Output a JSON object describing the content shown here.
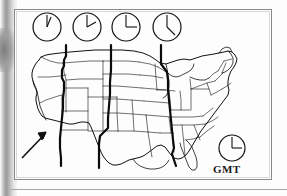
{
  "figure": {
    "kind": "us-time-zone-map",
    "title_text": "",
    "background_color": "#fdfdfd",
    "frame_color": "#8a8a8a",
    "ink_color": "#111111"
  },
  "clocks": {
    "timezone_row": [
      {
        "name": "pacific-clock",
        "cx": 47,
        "cy": 27,
        "r": 14,
        "hour_angle": 12,
        "minute_angle": 25,
        "label": ""
      },
      {
        "name": "mountain-clock",
        "cx": 87,
        "cy": 27,
        "r": 14,
        "hour_angle": 12,
        "minute_angle": 75,
        "label": ""
      },
      {
        "name": "central-clock",
        "cx": 126,
        "cy": 27,
        "r": 14,
        "hour_angle": 12,
        "minute_angle": 90,
        "label": ""
      },
      {
        "name": "eastern-clock",
        "cx": 167,
        "cy": 27,
        "r": 14,
        "hour_angle": 12,
        "minute_angle": 125,
        "label": ""
      }
    ],
    "gmt_clock": {
      "name": "gmt-clock",
      "cx": 232,
      "cy": 148,
      "r": 13,
      "hour_angle": 12,
      "minute_angle": 90,
      "label": "GMT",
      "label_x": 213,
      "label_y": 163
    }
  },
  "map": {
    "name": "us-map",
    "timezone_boundaries": [
      {
        "name": "pacific-mountain-boundary"
      },
      {
        "name": "mountain-central-boundary"
      },
      {
        "name": "central-eastern-boundary"
      }
    ],
    "annotation_arrow": {
      "name": "california-pointer-arrow",
      "tail_x": 22,
      "tail_y": 158,
      "head_x": 46,
      "head_y": 133
    }
  }
}
